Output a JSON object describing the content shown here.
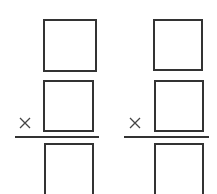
{
  "problems": [
    {
      "operator": "multiply",
      "operator_symbol": "×",
      "multiplicand_box": {
        "value": ""
      },
      "multiplier_box": {
        "value": ""
      },
      "product_box": {
        "value": ""
      }
    },
    {
      "operator": "multiply",
      "operator_symbol": "×",
      "multiplicand_box": {
        "value": ""
      },
      "multiplier_box": {
        "value": ""
      },
      "product_box": {
        "value": ""
      }
    }
  ],
  "colors": {
    "stroke": "#333333",
    "operator": "#444444",
    "background": "#ffffff"
  }
}
